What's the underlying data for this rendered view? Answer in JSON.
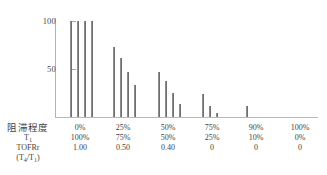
{
  "chart_data": {
    "type": "bar",
    "title": "",
    "xlabel": "",
    "ylabel": "",
    "ylim": [
      0,
      108
    ],
    "yticks": [
      50,
      100
    ],
    "ytick_labels": [
      "50",
      "100"
    ],
    "grid": false,
    "legend": null,
    "categories": [
      "0%",
      "25%",
      "50%",
      "75%",
      "90%",
      "100%"
    ],
    "series": [
      {
        "name": "T1",
        "values": [
          100,
          73,
          47,
          24,
          11,
          0
        ]
      },
      {
        "name": "T2",
        "values": [
          100,
          61,
          38,
          11,
          0,
          0
        ]
      },
      {
        "name": "T3",
        "values": [
          100,
          47,
          25,
          4,
          0,
          0
        ]
      },
      {
        "name": "T4",
        "values": [
          100,
          33,
          14,
          0,
          0,
          0
        ]
      }
    ],
    "groups": [
      {
        "label": "0%",
        "values": [
          100,
          100,
          100,
          100
        ]
      },
      {
        "label": "25%",
        "values": [
          73,
          61,
          47,
          33
        ]
      },
      {
        "label": "50%",
        "values": [
          47,
          38,
          25,
          14
        ]
      },
      {
        "label": "75%",
        "values": [
          24,
          11,
          4,
          0
        ]
      },
      {
        "label": "90%",
        "values": [
          11,
          0,
          0,
          0
        ]
      },
      {
        "label": "100%",
        "values": [
          0,
          0,
          0,
          0
        ]
      }
    ],
    "bar_color": "#6f6f6f"
  },
  "axis": {
    "tick_100": "100",
    "tick_50": "50"
  },
  "table": {
    "row_labels": {
      "block_degree": "阻滞程度",
      "t1": "T",
      "t1_sub": "1",
      "tofr": "TOFRr",
      "ratio": "(T",
      "ratio_sub_a": "4",
      "ratio_mid": "/T",
      "ratio_sub_b": "1",
      "ratio_end": ")"
    },
    "columns": [
      {
        "block": "0%",
        "t1": "100%",
        "tofr": "1.00"
      },
      {
        "block": "25%",
        "t1": "75%",
        "tofr": "0.50"
      },
      {
        "block": "50%",
        "t1": "50%",
        "tofr": "0.40"
      },
      {
        "block": "75%",
        "t1": "25%",
        "tofr": "0"
      },
      {
        "block": "90%",
        "t1": "10%",
        "tofr": "0"
      },
      {
        "block": "100%",
        "t1": "0%",
        "tofr": "0"
      }
    ]
  }
}
